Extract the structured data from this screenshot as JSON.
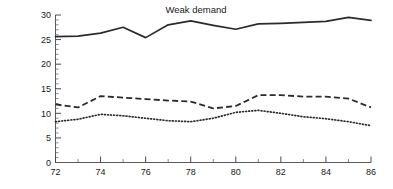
{
  "chart_data": {
    "type": "line",
    "title": "Weak demand",
    "xlabel": "",
    "ylabel": "",
    "xlim": [
      72,
      86
    ],
    "ylim": [
      0,
      30
    ],
    "grid": false,
    "legend": "none",
    "x_ticks_major": [
      72,
      74,
      76,
      78,
      80,
      82,
      84,
      86
    ],
    "x_ticks_minor": [
      73,
      75,
      77,
      79,
      81,
      83,
      85
    ],
    "y_ticks_major": [
      0,
      5,
      10,
      15,
      20,
      25,
      30
    ],
    "y_tick_minor_step": 1,
    "x": [
      72,
      73,
      74,
      75,
      76,
      77,
      78,
      79,
      80,
      81,
      82,
      83,
      84,
      85,
      86
    ],
    "series": [
      {
        "name": "solid-line",
        "style": "solid",
        "values": [
          25.6,
          25.7,
          26.3,
          27.5,
          25.4,
          28.0,
          28.8,
          27.9,
          27.1,
          28.2,
          28.3,
          28.5,
          28.7,
          29.5,
          28.9
        ]
      },
      {
        "name": "dashed-line",
        "style": "dashed",
        "values": [
          11.8,
          11.2,
          13.5,
          13.2,
          12.9,
          12.6,
          12.4,
          11.0,
          11.5,
          13.7,
          13.7,
          13.4,
          13.4,
          13.0,
          11.2
        ]
      },
      {
        "name": "dotted-line",
        "style": "dotted",
        "values": [
          8.3,
          8.8,
          9.8,
          9.5,
          9.0,
          8.5,
          8.3,
          9.0,
          10.2,
          10.6,
          10.0,
          9.3,
          8.9,
          8.3,
          7.5
        ]
      }
    ]
  },
  "axis_labels": {
    "y": [
      "30",
      "25",
      "20",
      "15",
      "10",
      "5",
      "0"
    ],
    "x": [
      "72",
      "74",
      "76",
      "78",
      "80",
      "82",
      "84",
      "86"
    ]
  },
  "colors": {
    "ink": "#2b2b2b",
    "axis": "#5a5a5a",
    "background": "#ffffff"
  }
}
